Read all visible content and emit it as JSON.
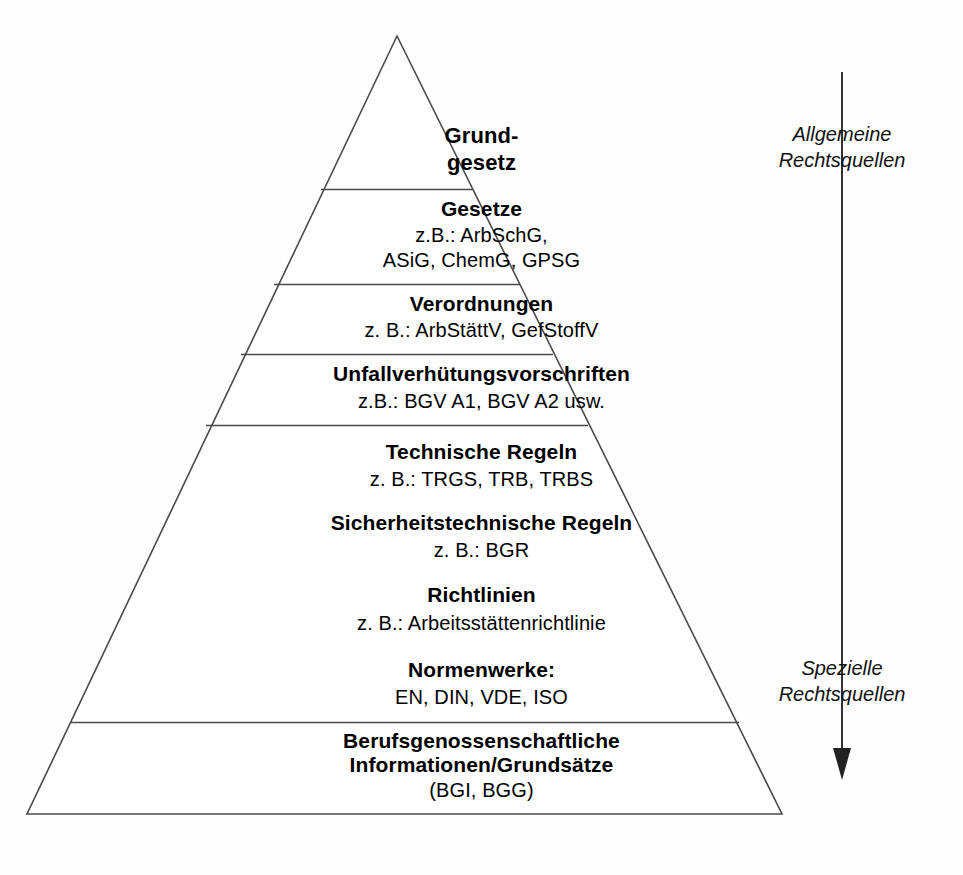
{
  "diagram": {
    "shape": "pyramid",
    "line_color": "#444444",
    "text_color": "#000000",
    "background": "#ffffff"
  },
  "levels": [
    {
      "id": "grundgesetz",
      "title": "Grund-\ngesetz",
      "subtitle": ""
    },
    {
      "id": "gesetze",
      "title": "Gesetze",
      "subtitle": "z.B.: ArbSchG,\nASiG, ChemG, GPSG"
    },
    {
      "id": "verordnungen",
      "title": "Verordnungen",
      "subtitle": "z. B.: ArbStättV, GefStoffV"
    },
    {
      "id": "unfallverhuetungsvorschriften",
      "title": "Unfallverhütungsvorschriften",
      "subtitle": "z.B.: BGV A1, BGV A2 usw."
    },
    {
      "id": "technische-regeln",
      "title": "Technische Regeln",
      "subtitle": "z. B.: TRGS, TRB, TRBS"
    },
    {
      "id": "sicherheitstechnische-regeln",
      "title": "Sicherheitstechnische Regeln",
      "subtitle": "z. B.: BGR"
    },
    {
      "id": "richtlinien",
      "title": "Richtlinien",
      "subtitle": "z. B.: Arbeitsstättenrichtlinie"
    },
    {
      "id": "normenwerke",
      "title": "Normenwerke:",
      "subtitle": "EN, DIN, VDE, ISO"
    },
    {
      "id": "berufsgenossenschaftliche",
      "title": "Berufsgenossenschaftliche\nInformationen/Grundsätze",
      "subtitle": "(BGI, BGG)"
    }
  ],
  "level_text": {
    "grundgesetz_line1": "Grund-",
    "grundgesetz_line2": "gesetz",
    "gesetze_title": "Gesetze",
    "gesetze_sub1": "z.B.: ArbSchG,",
    "gesetze_sub2": "ASiG, ChemG, GPSG",
    "verordnungen_title": "Verordnungen",
    "verordnungen_sub": "z. B.: ArbStättV, GefStoffV",
    "uvv_title": "Unfallverhütungsvorschriften",
    "uvv_sub": "z.B.: BGV A1, BGV A2 usw.",
    "technische_title": "Technische Regeln",
    "technische_sub": "z. B.: TRGS, TRB, TRBS",
    "sicherheitstechnische_title": "Sicherheitstechnische Regeln",
    "sicherheitstechnische_sub": "z. B.: BGR",
    "richtlinien_title": "Richtlinien",
    "richtlinien_sub": "z. B.: Arbeitsstättenrichtlinie",
    "normenwerke_title": "Normenwerke:",
    "normenwerke_sub": "EN, DIN, VDE, ISO",
    "bg_title1": "Berufsgenossenschaftliche",
    "bg_title2": "Informationen/Grundsätze",
    "bg_sub": "(BGI, BGG)"
  },
  "annotations": {
    "top_label": "Allgemeine\nRechtsquellen",
    "bottom_label": "Spezielle\nRechtsquellen",
    "arrow_direction": "down"
  }
}
